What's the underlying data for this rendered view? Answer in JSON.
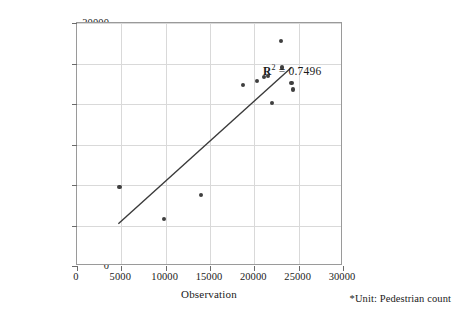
{
  "chart_data": {
    "type": "scatter",
    "title": "",
    "xlabel": "Observation",
    "ylabel": "Simulation",
    "xlim": [
      0,
      30000
    ],
    "ylim": [
      0,
      30000
    ],
    "xticks": [
      0,
      5000,
      10000,
      15000,
      20000,
      25000,
      30000
    ],
    "yticks": [
      0,
      5000,
      10000,
      15000,
      20000,
      25000,
      30000
    ],
    "xtick_labels": [
      "0",
      "5000",
      "10000",
      "15000",
      "20000",
      "25000",
      "30000"
    ],
    "ytick_labels": [
      "0",
      "5000",
      "10000",
      "15000",
      "20000",
      "25000",
      "30000"
    ],
    "grid": true,
    "legend": null,
    "series": [
      {
        "name": "Observation vs Simulation",
        "marker": "circle",
        "color": "#3f3f3f",
        "points": [
          {
            "x": 4800,
            "y": 9800
          },
          {
            "x": 9800,
            "y": 5800
          },
          {
            "x": 14000,
            "y": 8800
          },
          {
            "x": 18700,
            "y": 22300
          },
          {
            "x": 20300,
            "y": 22800
          },
          {
            "x": 21100,
            "y": 23300
          },
          {
            "x": 21500,
            "y": 23500
          },
          {
            "x": 22000,
            "y": 20100
          },
          {
            "x": 23000,
            "y": 27800
          },
          {
            "x": 23100,
            "y": 24500
          },
          {
            "x": 24200,
            "y": 22600
          },
          {
            "x": 24400,
            "y": 21800
          }
        ]
      }
    ],
    "trendline": {
      "type": "linear",
      "x_start": 4700,
      "y_start": 5000,
      "x_end": 24400,
      "y_end": 24500
    },
    "annotations": [
      {
        "name": "r-squared",
        "symbol": "R",
        "exponent": "2",
        "equals": " = ",
        "value": "0.7496",
        "full_text": "R2 = 0.7496"
      }
    ],
    "footnote": "*Unit: Pedestrian count"
  },
  "axes": {
    "x_title": "Observation",
    "y_title": "Simulation"
  },
  "footnote": {
    "text": "*Unit: Pedestrian count"
  },
  "annotation": {
    "r2_symbol": "R",
    "r2_exponent": "2",
    "r2_equals": " = ",
    "r2_value": "0.7496"
  }
}
